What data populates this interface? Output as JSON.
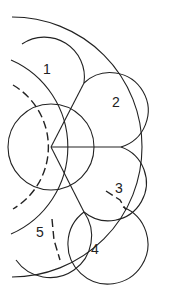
{
  "diagram": {
    "stroke_color": "#222222",
    "background": "#ffffff",
    "labels": [
      {
        "id": "1",
        "text": "1",
        "x": 43,
        "y": 74
      },
      {
        "id": "2",
        "text": "2",
        "x": 112,
        "y": 107
      },
      {
        "id": "3",
        "text": "3",
        "x": 115,
        "y": 193
      },
      {
        "id": "4",
        "text": "4",
        "x": 91,
        "y": 254
      },
      {
        "id": "5",
        "text": "5",
        "x": 36,
        "y": 237
      }
    ]
  }
}
